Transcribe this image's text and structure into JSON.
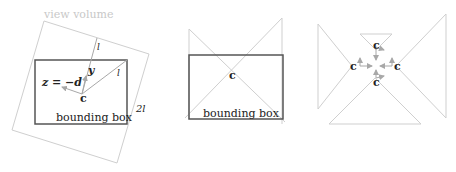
{
  "panels": [
    {
      "id": "left",
      "labels": {
        "view_volume": "view volume",
        "l_top": "l",
        "l_diag": "l",
        "y": "y",
        "z_eq": "z = −d",
        "c": "c",
        "two_l": "2l",
        "bounding_box": "bounding box"
      }
    },
    {
      "id": "middle",
      "labels": {
        "c": "c",
        "bounding_box": "bounding box"
      }
    },
    {
      "id": "right",
      "labels": {
        "c_top": "c",
        "c_left": "c",
        "c_right": "c",
        "c_bottom": "c"
      }
    }
  ],
  "colors": {
    "box_stroke": "#555555",
    "light_stroke": "#cfcfcf",
    "arrow": "#a8a8a8",
    "text": "#222222",
    "faint_text": "#c8c8c8"
  }
}
